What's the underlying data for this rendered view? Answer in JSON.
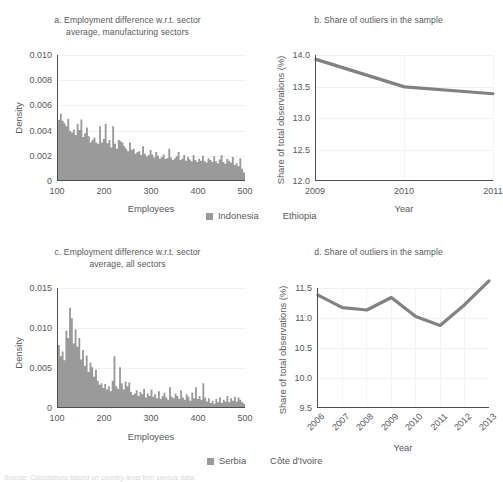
{
  "figure": {
    "panels": [
      {
        "key": "a",
        "title": "a. Employment difference w.r.t. sector average, manufacturing sectors",
        "title_line1": "a. Employment difference w.r.t. sector",
        "title_line2": "average, manufacturing sectors"
      },
      {
        "key": "b",
        "title": "b. Share of outliers in the sample",
        "title_line1": "b. Share of outliers in the sample",
        "title_line2": ""
      },
      {
        "key": "c",
        "title": "c. Employment difference w.r.t. sector average, all sectors",
        "title_line1": "c. Employment difference w.r.t. sector",
        "title_line2": "average, all sectors"
      },
      {
        "key": "d",
        "title": "d. Share of outliers in the sample",
        "title_line1": "d. Share of outliers in the sample",
        "title_line2": ""
      }
    ],
    "legend_top": {
      "items": [
        {
          "label": "Indonesia",
          "marker": "square",
          "color": "#9a9a9a"
        },
        {
          "label": "Ethiopia",
          "marker": "line",
          "color": "#808285"
        }
      ]
    },
    "legend_bottom": {
      "items": [
        {
          "label": "Serbia",
          "marker": "square",
          "color": "#9a9a9a"
        },
        {
          "label": "Côte d'Ivoire",
          "marker": "line",
          "color": "#808285"
        }
      ]
    },
    "source_note": "Source: Calculations based on country-level firm census data."
  },
  "chart_data": [
    {
      "id": "panel-a",
      "type": "bar",
      "title": "a. Employment difference w.r.t. sector average, manufacturing sectors",
      "xlabel": "Employees",
      "ylabel": "Density",
      "series_name": "Indonesia",
      "color": "#9a9a9a",
      "xlim": [
        100,
        500
      ],
      "ylim": [
        0,
        0.01
      ],
      "xticks": [
        100,
        200,
        300,
        400,
        500
      ],
      "yticks": [
        0,
        0.002,
        0.004,
        0.006,
        0.008,
        0.01
      ],
      "ytick_labels": [
        "0",
        "0.002",
        "0.004",
        "0.006",
        "0.008",
        "0.010"
      ],
      "grid": "horizontal",
      "bin_width": 4,
      "x": [
        100,
        104,
        108,
        112,
        116,
        120,
        124,
        128,
        132,
        136,
        140,
        144,
        148,
        152,
        156,
        160,
        164,
        168,
        172,
        176,
        180,
        184,
        188,
        192,
        196,
        200,
        204,
        208,
        212,
        216,
        220,
        224,
        228,
        232,
        236,
        240,
        244,
        248,
        252,
        256,
        260,
        264,
        268,
        272,
        276,
        280,
        284,
        288,
        292,
        296,
        300,
        304,
        308,
        312,
        316,
        320,
        324,
        328,
        332,
        336,
        340,
        344,
        348,
        352,
        356,
        360,
        364,
        368,
        372,
        376,
        380,
        384,
        388,
        392,
        396,
        400,
        404,
        408,
        412,
        416,
        420,
        424,
        428,
        432,
        436,
        440,
        444,
        448,
        452,
        456,
        460,
        464,
        468,
        472,
        476,
        480,
        484,
        488,
        492,
        496
      ],
      "values": [
        0.0048,
        0.0053,
        0.00475,
        0.00455,
        0.0043,
        0.0049,
        0.00395,
        0.0038,
        0.00405,
        0.0036,
        0.0045,
        0.004,
        0.00485,
        0.00345,
        0.00375,
        0.0042,
        0.0035,
        0.003,
        0.0032,
        0.0034,
        0.003,
        0.0029,
        0.0043,
        0.003,
        0.0033,
        0.0045,
        0.00295,
        0.0032,
        0.0026,
        0.0043,
        0.0029,
        0.0025,
        0.0032,
        0.0031,
        0.003,
        0.0027,
        0.0025,
        0.0023,
        0.003,
        0.0024,
        0.0025,
        0.0021,
        0.00225,
        0.0023,
        0.002,
        0.0027,
        0.0021,
        0.0019,
        0.002,
        0.0024,
        0.00205,
        0.0018,
        0.00225,
        0.00195,
        0.0017,
        0.00185,
        0.00205,
        0.0017,
        0.00175,
        0.0025,
        0.0018,
        0.0016,
        0.00175,
        0.0019,
        0.00225,
        0.0016,
        0.0017,
        0.002,
        0.00155,
        0.00185,
        0.00165,
        0.0015,
        0.002,
        0.0016,
        0.00145,
        0.0017,
        0.00155,
        0.00195,
        0.0015,
        0.0014,
        0.00175,
        0.0016,
        0.00145,
        0.0019,
        0.0015,
        0.00135,
        0.00165,
        0.002,
        0.00145,
        0.0013,
        0.0017,
        0.00155,
        0.0014,
        0.00185,
        0.0012,
        0.00135,
        0.0011,
        0.00175,
        0.0009,
        0.0006
      ]
    },
    {
      "id": "panel-b",
      "type": "line",
      "title": "b. Share of outliers in the sample",
      "xlabel": "Year",
      "ylabel": "Share of total observations (%)",
      "series_name": "Ethiopia",
      "color": "#808285",
      "xlim": [
        2009,
        2011
      ],
      "ylim": [
        12.0,
        14.0
      ],
      "xticks": [
        2009,
        2010,
        2011
      ],
      "xtick_labels": [
        "2009",
        "2010",
        "2011"
      ],
      "yticks": [
        12.0,
        12.5,
        13.0,
        13.5,
        14.0
      ],
      "ytick_labels": [
        "12.0",
        "12.5",
        "13.0",
        "13.5",
        "14.0"
      ],
      "grid": "both",
      "x": [
        2009,
        2010,
        2011
      ],
      "values": [
        13.93,
        13.49,
        13.38
      ]
    },
    {
      "id": "panel-c",
      "type": "bar",
      "title": "c. Employment difference w.r.t. sector average, all sectors",
      "xlabel": "Employees",
      "ylabel": "Density",
      "series_name": "Serbia",
      "color": "#9a9a9a",
      "xlim": [
        100,
        500
      ],
      "ylim": [
        0,
        0.015
      ],
      "xticks": [
        100,
        200,
        300,
        400,
        500
      ],
      "yticks": [
        0,
        0.005,
        0.01,
        0.015
      ],
      "ytick_labels": [
        "0",
        "0.005",
        "0.010",
        "0.015"
      ],
      "grid": "horizontal",
      "bin_width": 4,
      "x": [
        100,
        104,
        108,
        112,
        116,
        120,
        124,
        128,
        132,
        136,
        140,
        144,
        148,
        152,
        156,
        160,
        164,
        168,
        172,
        176,
        180,
        184,
        188,
        192,
        196,
        200,
        204,
        208,
        212,
        216,
        220,
        224,
        228,
        232,
        236,
        240,
        244,
        248,
        252,
        256,
        260,
        264,
        268,
        272,
        276,
        280,
        284,
        288,
        292,
        296,
        300,
        304,
        308,
        312,
        316,
        320,
        324,
        328,
        332,
        336,
        340,
        344,
        348,
        352,
        356,
        360,
        364,
        368,
        372,
        376,
        380,
        384,
        388,
        392,
        396,
        400,
        404,
        408,
        412,
        416,
        420,
        424,
        428,
        432,
        436,
        440,
        444,
        448,
        452,
        456,
        460,
        464,
        468,
        472,
        476,
        480,
        484,
        488,
        492,
        496
      ],
      "values": [
        0.0078,
        0.0064,
        0.007,
        0.0059,
        0.0096,
        0.0087,
        0.0125,
        0.0112,
        0.008,
        0.0098,
        0.0076,
        0.0087,
        0.006,
        0.0072,
        0.0052,
        0.0065,
        0.0044,
        0.0056,
        0.005,
        0.0038,
        0.0047,
        0.0033,
        0.0028,
        0.003,
        0.0024,
        0.0029,
        0.0022,
        0.0026,
        0.002,
        0.0033,
        0.0064,
        0.0026,
        0.0023,
        0.005,
        0.003,
        0.0022,
        0.0032,
        0.0026,
        0.0031,
        0.0019,
        0.0015,
        0.0017,
        0.0021,
        0.0014,
        0.0019,
        0.0016,
        0.0023,
        0.0012,
        0.0017,
        0.0014,
        0.0022,
        0.0013,
        0.0016,
        0.0011,
        0.002,
        0.001,
        0.0014,
        0.0018,
        0.0012,
        0.0009,
        0.0025,
        0.0013,
        0.0011,
        0.0017,
        0.0014,
        0.001,
        0.0021,
        0.0012,
        0.0009,
        0.0016,
        0.0013,
        0.0008,
        0.0018,
        0.0011,
        0.0025,
        0.001,
        0.0014,
        0.0009,
        0.003,
        0.0012,
        0.0007,
        0.0011,
        0.0005,
        0.0008,
        0.0004,
        0.001,
        0.0006,
        0.0012,
        0.0005,
        0.0009,
        0.0007,
        0.0014,
        0.0006,
        0.0011,
        0.0008,
        0.0013,
        0.0007,
        0.0012,
        0.0009,
        0.0006,
        0.0004
      ]
    },
    {
      "id": "panel-d",
      "type": "line",
      "title": "d. Share of outliers in the sample",
      "xlabel": "Year",
      "ylabel": "Share of total observations (%)",
      "series_name": "Côte d'Ivoire",
      "color": "#808285",
      "xlim": [
        2006,
        2013
      ],
      "ylim": [
        9.5,
        11.5
      ],
      "xticks": [
        2006,
        2007,
        2008,
        2009,
        2010,
        2011,
        2012,
        2013
      ],
      "xtick_labels": [
        "2006",
        "2007",
        "2008",
        "2009",
        "2010",
        "2011",
        "2012",
        "2013"
      ],
      "yticks": [
        9.5,
        10.0,
        10.5,
        11.0,
        11.5
      ],
      "ytick_labels": [
        "9.5",
        "10.0",
        "10.5",
        "11.0",
        "11.5"
      ],
      "grid": "both",
      "x": [
        2006,
        2007,
        2008,
        2009,
        2010,
        2011,
        2012,
        2013
      ],
      "values": [
        11.38,
        11.17,
        11.13,
        11.34,
        11.02,
        10.87,
        11.22,
        11.62
      ]
    }
  ]
}
